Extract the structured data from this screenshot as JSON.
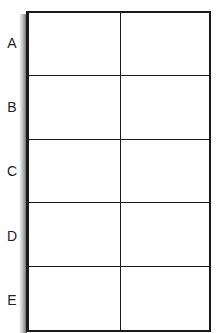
{
  "diagram": {
    "type": "grid-table",
    "rows": 5,
    "columns": 2,
    "row_labels": [
      "A",
      "B",
      "C",
      "D",
      "E"
    ],
    "cells": [
      [
        "",
        ""
      ],
      [
        "",
        ""
      ],
      [
        "",
        ""
      ],
      [
        "",
        ""
      ],
      [
        "",
        ""
      ]
    ],
    "colors": {
      "line": "#1a1a1a",
      "background": "#ffffff",
      "label": "#222222"
    }
  }
}
